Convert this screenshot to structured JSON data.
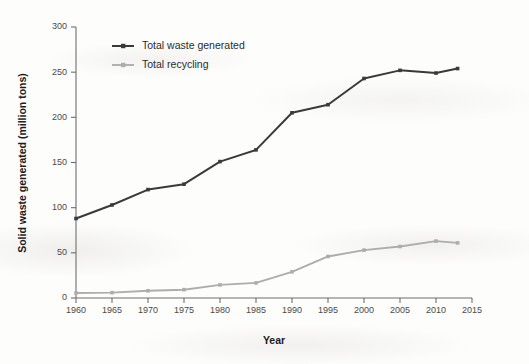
{
  "chart_data": {
    "type": "line",
    "title": "",
    "xlabel": "Year",
    "ylabel": "Solid waste generated (million tons)",
    "x": [
      1960,
      1965,
      1970,
      1975,
      1980,
      1985,
      1990,
      1995,
      2000,
      2005,
      2010,
      2013
    ],
    "xlim": [
      1960,
      2015
    ],
    "ylim": [
      0,
      300
    ],
    "xticks": [
      1960,
      1965,
      1970,
      1975,
      1980,
      1985,
      1990,
      1995,
      2000,
      2005,
      2010,
      2015
    ],
    "yticks": [
      0,
      50,
      100,
      150,
      200,
      250,
      300
    ],
    "grid": false,
    "legend_position": "top-left-inside",
    "series": [
      {
        "name": "Total waste generated",
        "color": "#3a3a3a",
        "marker": "square",
        "values": [
          88,
          103,
          120,
          126,
          151,
          164,
          205,
          214,
          243,
          252,
          249,
          254
        ]
      },
      {
        "name": "Total recycling",
        "color": "#adadad",
        "marker": "square",
        "values": [
          5.6,
          5.9,
          8,
          9.2,
          14.5,
          16.7,
          29,
          46,
          53,
          57,
          63,
          61
        ]
      }
    ]
  },
  "axes": {
    "y_tick_labels": [
      "0",
      "50",
      "100",
      "150",
      "200",
      "250",
      "300"
    ],
    "x_tick_labels": [
      "1960",
      "1965",
      "1970",
      "1975",
      "1980",
      "1985",
      "1990",
      "1995",
      "2000",
      "2005",
      "2010",
      "2015"
    ],
    "x_axis_title": "Year",
    "y_axis_title": "Solid waste generated (million tons)"
  },
  "legend": {
    "items": [
      {
        "label": "Total waste generated",
        "color": "#3a3a3a"
      },
      {
        "label": "Total recycling",
        "color": "#adadad"
      }
    ]
  }
}
